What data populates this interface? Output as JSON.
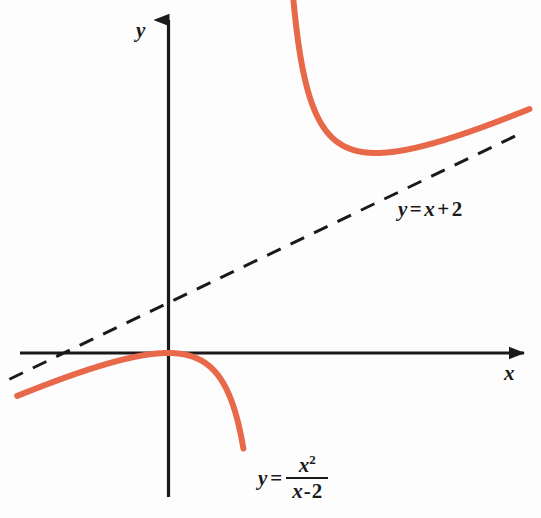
{
  "figure": {
    "background_color": "#fdfdfd",
    "axis_color": "#1a1a1a",
    "curve_color": "#e8684a",
    "asymptote_color": "#1a1a1a"
  },
  "axes": {
    "y_label": "y",
    "x_label": "x"
  },
  "labels": {
    "asymptote": {
      "lhs": "y",
      "equals": "=",
      "rhs_var": "x",
      "plus": "+",
      "constant": "2",
      "full_text": "y = x + 2"
    },
    "curve": {
      "lhs": "y",
      "equals": "=",
      "numerator_base": "x",
      "numerator_exponent": "2",
      "denominator_var": "x",
      "denominator_minus": "-",
      "denominator_constant": "2",
      "full_text": "y = x^2/(x - 2)"
    }
  },
  "chart_data": {
    "type": "line",
    "title": "",
    "xlabel": "x",
    "ylabel": "y",
    "grid": false,
    "legend": "none",
    "origin_px": [
      168,
      353
    ],
    "x_scale_px_per_unit": 52,
    "y_scale_px_per_unit": 25,
    "xlim": [
      -2.9,
      7.0
    ],
    "ylim": [
      -5.8,
      13.6
    ],
    "series": [
      {
        "name": "y = x^2/(x - 2)",
        "color": "#e8684a",
        "style": "solid",
        "width_px": 6,
        "vertical_asymptote": 2,
        "hole_none": true,
        "local_maximum": [
          0,
          0
        ],
        "local_minimum": [
          4,
          8
        ],
        "branches": [
          {
            "name": "left-branch",
            "x_range": [
              -2.9,
              1.45
            ],
            "points": [
              [
                -2.9,
                -1.72
              ],
              [
                -2.5,
                -1.39
              ],
              [
                -2.0,
                -1.0
              ],
              [
                -1.5,
                -0.64
              ],
              [
                -1.0,
                -0.33
              ],
              [
                -0.5,
                -0.1
              ],
              [
                0.0,
                0.0
              ],
              [
                0.5,
                -0.17
              ],
              [
                0.8,
                -0.53
              ],
              [
                1.0,
                -1.0
              ],
              [
                1.2,
                -1.8
              ],
              [
                1.35,
                -2.81
              ],
              [
                1.45,
                -3.82
              ]
            ]
          },
          {
            "name": "right-branch",
            "x_range": [
              2.2,
              6.95
            ],
            "points": [
              [
                2.2,
                24.2
              ],
              [
                2.4,
                14.4
              ],
              [
                2.6,
                11.27
              ],
              [
                3.0,
                9.0
              ],
              [
                3.5,
                8.17
              ],
              [
                4.0,
                8.0
              ],
              [
                4.5,
                8.1
              ],
              [
                5.0,
                8.33
              ],
              [
                5.5,
                8.64
              ],
              [
                6.0,
                9.0
              ],
              [
                6.5,
                9.39
              ],
              [
                6.95,
                9.76
              ]
            ]
          }
        ]
      },
      {
        "name": "y = x + 2",
        "color": "#1a1a1a",
        "style": "dashed",
        "width_px": 3,
        "slope": 1,
        "intercept": 2,
        "x_range": [
          -3.05,
          6.75
        ],
        "points": [
          [
            -3.05,
            -1.05
          ],
          [
            6.75,
            8.75
          ]
        ]
      }
    ],
    "annotations": [
      {
        "text": "y = x + 2",
        "x_px": 398,
        "y_px": 199,
        "target": "asymptote"
      },
      {
        "text": "y = x^2/(x - 2)",
        "x_px": 258,
        "y_px": 455,
        "target": "curve"
      }
    ]
  }
}
